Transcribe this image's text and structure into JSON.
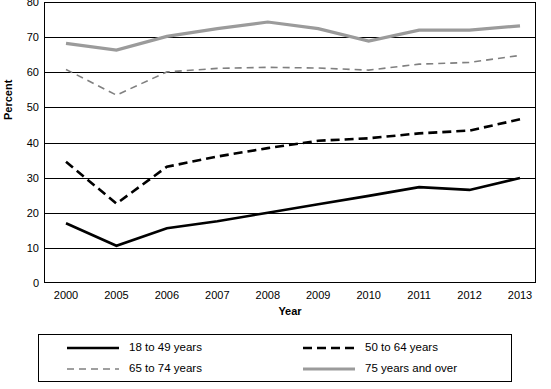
{
  "chart_data": {
    "type": "line",
    "title": "",
    "xlabel": "Year",
    "ylabel": "Percent",
    "ylim": [
      0,
      80
    ],
    "ytick_labels": [
      "0",
      "10",
      "20",
      "30",
      "40",
      "50",
      "60",
      "70",
      "80"
    ],
    "grid": true,
    "legend_position": "bottom",
    "categories": [
      "2000",
      "2005",
      "2006",
      "2007",
      "2008",
      "2009",
      "2010",
      "2011",
      "2012",
      "2013"
    ],
    "series": [
      {
        "name": "18 to 49 years",
        "color": "#000000",
        "style": "solid",
        "width": 2.6,
        "values": [
          17.0,
          10.6,
          15.6,
          17.6,
          20.0,
          22.4,
          24.8,
          27.3,
          26.5,
          29.9
        ]
      },
      {
        "name": "50 to 64 years",
        "color": "#000000",
        "style": "dashed",
        "width": 2.6,
        "values": [
          34.5,
          22.6,
          33.1,
          36.0,
          38.4,
          40.5,
          41.2,
          42.6,
          43.4,
          46.6
        ]
      },
      {
        "name": "65 to 74 years",
        "color": "#808080",
        "style": "dashed",
        "width": 1.6,
        "values": [
          60.8,
          53.5,
          60.1,
          61.1,
          61.4,
          61.2,
          60.6,
          62.3,
          62.8,
          64.8
        ]
      },
      {
        "name": "75 years and over",
        "color": "#9b9b9b",
        "style": "solid",
        "width": 3.2,
        "values": [
          68.2,
          66.3,
          70.2,
          72.4,
          74.3,
          72.4,
          68.9,
          72.0,
          72.0,
          73.2
        ]
      }
    ]
  },
  "legend": {
    "items": [
      {
        "label": "18 to 49 years"
      },
      {
        "label": "50 to 64 years"
      },
      {
        "label": "65 to 74 years"
      },
      {
        "label": "75 years and over"
      }
    ]
  }
}
